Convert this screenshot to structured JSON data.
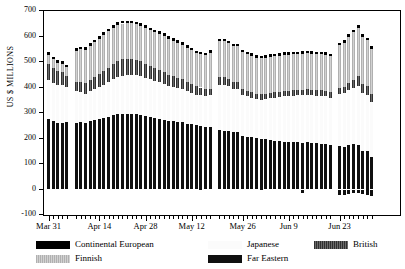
{
  "chart_data": {
    "type": "bar",
    "stacked": true,
    "title": "",
    "xlabel": "",
    "ylabel": "US $ MILLIONS",
    "ylim": [
      -100,
      700
    ],
    "ytick_step": 100,
    "yticks": [
      700,
      600,
      500,
      400,
      300,
      200,
      100,
      0,
      -100
    ],
    "grid": false,
    "legend_position": "bottom",
    "series_order_bottom_to_top": [
      "Far Eastern",
      "Japanese",
      "British",
      "Finnish",
      "Continental European"
    ],
    "series": [
      {
        "name": "Far Eastern",
        "color": "#101010",
        "values": [
          278,
          268,
          262,
          262,
          263,
          262,
          264,
          262,
          268,
          272,
          276,
          280,
          286,
          292,
          296,
          297,
          296,
          298,
          296,
          292,
          288,
          284,
          280,
          276,
          272,
          268,
          268,
          266,
          264,
          258,
          256,
          252,
          250,
          246,
          244,
          232,
          230,
          228,
          226,
          227,
          208,
          206,
          204,
          202,
          200,
          198,
          196,
          192,
          190,
          188,
          186,
          186,
          185,
          184,
          186,
          184,
          182,
          180,
          178,
          176,
          170,
          168,
          176,
          178,
          176,
          152,
          150,
          128
        ]
      },
      {
        "name": "Japanese",
        "color": "#fbfbfb",
        "values": [
          152,
          150,
          148,
          146,
          138,
          124,
          118,
          114,
          118,
          122,
          126,
          130,
          134,
          140,
          146,
          150,
          152,
          152,
          152,
          152,
          150,
          148,
          146,
          144,
          142,
          138,
          134,
          132,
          130,
          128,
          124,
          120,
          120,
          122,
          126,
          178,
          180,
          176,
          168,
          168,
          164,
          160,
          156,
          152,
          152,
          156,
          162,
          168,
          172,
          178,
          180,
          182,
          184,
          186,
          186,
          186,
          186,
          188,
          188,
          184,
          206,
          210,
          214,
          220,
          230,
          226,
          222,
          216
        ]
      },
      {
        "name": "British",
        "color": "#4a4a4a",
        "values": [
          64,
          58,
          54,
          52,
          44,
          34,
          38,
          40,
          44,
          48,
          52,
          56,
          58,
          60,
          62,
          64,
          64,
          62,
          60,
          58,
          56,
          52,
          50,
          48,
          46,
          44,
          42,
          40,
          38,
          36,
          34,
          32,
          30,
          28,
          26,
          30,
          30,
          28,
          26,
          25,
          24,
          22,
          22,
          22,
          22,
          22,
          22,
          22,
          22,
          22,
          22,
          22,
          22,
          22,
          22,
          22,
          22,
          22,
          22,
          22,
          22,
          24,
          28,
          32,
          38,
          34,
          32,
          30
        ]
      },
      {
        "name": "Finnish",
        "color": "#b9b9b9",
        "values": [
          32,
          34,
          34,
          32,
          34,
          124,
          130,
          132,
          134,
          136,
          138,
          140,
          142,
          142,
          142,
          140,
          140,
          140,
          140,
          140,
          140,
          140,
          140,
          142,
          142,
          142,
          140,
          138,
          136,
          134,
          132,
          130,
          130,
          130,
          140,
          142,
          142,
          142,
          142,
          142,
          142,
          142,
          142,
          140,
          140,
          140,
          140,
          140,
          140,
          140,
          140,
          140,
          140,
          140,
          140,
          140,
          140,
          140,
          140,
          140,
          168,
          174,
          180,
          186,
          190,
          186,
          182,
          178
        ]
      },
      {
        "name": "Continental European",
        "color": "#000000",
        "values": [
          12,
          10,
          10,
          10,
          10,
          10,
          10,
          10,
          10,
          10,
          10,
          10,
          10,
          10,
          10,
          10,
          10,
          10,
          10,
          10,
          10,
          10,
          10,
          10,
          10,
          10,
          10,
          10,
          10,
          10,
          10,
          10,
          10,
          10,
          10,
          10,
          10,
          10,
          10,
          10,
          10,
          10,
          10,
          10,
          10,
          10,
          10,
          10,
          10,
          10,
          10,
          10,
          10,
          10,
          10,
          10,
          10,
          10,
          10,
          10,
          10,
          10,
          10,
          10,
          10,
          10,
          10,
          10
        ]
      },
      {
        "name": "Below zero",
        "color": "#101010",
        "values": [
          0,
          0,
          0,
          0,
          0,
          0,
          0,
          0,
          0,
          0,
          0,
          0,
          0,
          0,
          0,
          0,
          0,
          0,
          0,
          0,
          0,
          0,
          0,
          0,
          0,
          0,
          0,
          0,
          0,
          0,
          0,
          0,
          0,
          0,
          0,
          0,
          0,
          0,
          0,
          0,
          0,
          0,
          0,
          0,
          0,
          0,
          0,
          0,
          0,
          0,
          0,
          0,
          0,
          -14,
          0,
          0,
          0,
          0,
          0,
          0,
          -22,
          -20,
          -18,
          -14,
          -12,
          -18,
          -20,
          -26
        ]
      }
    ],
    "bar_gaps_after_index": [
      4,
      34,
      59
    ],
    "xtick_labels": [
      "Mar 31",
      "Apr 14",
      "Apr 28",
      "May 12",
      "May 26",
      "Jun 9",
      "Jun 23",
      "Jul 7"
    ],
    "xtick_label_indices": [
      0,
      10,
      20,
      30,
      40,
      50,
      60,
      70
    ],
    "n_minor_ticks": 75
  },
  "axes": {
    "y_title": "US $ MILLIONS",
    "y_labels": [
      "700",
      "600",
      "500",
      "400",
      "300",
      "200",
      "100",
      "0",
      "-100"
    ],
    "x_labels": [
      "Mar 31",
      "Apr 14",
      "Apr 28",
      "May 12",
      "May 26",
      "Jun 9",
      "Jun 23",
      "Jul 7"
    ]
  },
  "legend": {
    "items": [
      {
        "label": "Continental European",
        "swatch": "continental",
        "row": 0,
        "col": 0
      },
      {
        "label": "Japanese",
        "swatch": "japanese",
        "row": 0,
        "col": 1
      },
      {
        "label": "British",
        "swatch": "british",
        "row": 0,
        "col": 2
      },
      {
        "label": "Finnish",
        "swatch": "finnish",
        "row": 1,
        "col": 0
      },
      {
        "label": "Far Eastern",
        "swatch": "fareastern",
        "row": 1,
        "col": 1
      }
    ]
  },
  "colors": {
    "continental": "#000000",
    "japanese": "#fbfbfb",
    "british": "#4a4a4a",
    "finnish": "#b9b9b9",
    "fareastern": "#101010",
    "axis": "#000000",
    "background": "#ffffff"
  }
}
